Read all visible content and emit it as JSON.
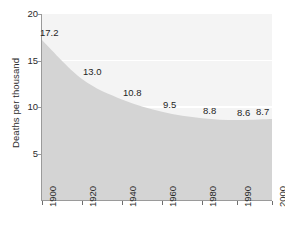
{
  "chart_data": {
    "type": "area",
    "title": "",
    "subtitle": "",
    "xlabel": "",
    "ylabel": "Deaths per thousand",
    "categories": [
      "1900",
      "1920",
      "1940",
      "1960",
      "1980",
      "1990",
      "2000"
    ],
    "values": [
      17.2,
      13.0,
      10.8,
      9.5,
      8.8,
      8.6,
      8.7
    ],
    "data_labels": [
      "17.2",
      "13.0",
      "10.8",
      "9.5",
      "8.8",
      "8.6",
      "8.7"
    ],
    "ylim": [
      0,
      20
    ],
    "y_ticks": [
      5,
      10,
      15,
      20
    ],
    "y_tick_labels": [
      "5",
      "10",
      "15",
      "20"
    ],
    "x_ticks": [
      "1900",
      "1920",
      "1940",
      "1960",
      "1980",
      "1990",
      "2000"
    ],
    "grid": "horizontal-white-at-10-and-15",
    "legend": "none",
    "legend_position": "none",
    "annotations": [],
    "colors": {
      "area_fill": "#d4d4d4",
      "plot_background": "#f4f4f4",
      "gridline": "#ffffff",
      "axis_line": "#9a9a9a",
      "text": "#2b2b2b",
      "label_text": "#1f1f1f",
      "page_background": "#ffffff"
    }
  }
}
